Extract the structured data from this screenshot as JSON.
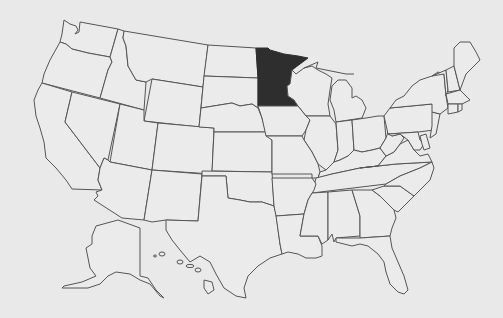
{
  "map": {
    "title": "United States map",
    "highlighted_state": "Minnesota",
    "colors": {
      "background": "#e9e9e9",
      "state_fill": "#ebebeb",
      "border": "#555555",
      "highlight": "#2e2e2e"
    },
    "states_shown": [
      "Washington",
      "Oregon",
      "California",
      "Idaho",
      "Nevada",
      "Montana",
      "Wyoming",
      "Utah",
      "Arizona",
      "Colorado",
      "New Mexico",
      "North Dakota",
      "South Dakota",
      "Nebraska",
      "Kansas",
      "Oklahoma",
      "Texas",
      "Minnesota",
      "Iowa",
      "Missouri",
      "Arkansas",
      "Louisiana",
      "Wisconsin",
      "Illinois",
      "Michigan",
      "Indiana",
      "Ohio",
      "Kentucky",
      "Tennessee",
      "Mississippi",
      "Alabama",
      "Georgia",
      "Florida",
      "South Carolina",
      "North Carolina",
      "Virginia",
      "West Virginia",
      "Pennsylvania",
      "New York",
      "Maryland",
      "Delaware",
      "New Jersey",
      "Connecticut",
      "Rhode Island",
      "Massachusetts",
      "Vermont",
      "New Hampshire",
      "Maine",
      "Alaska",
      "Hawaii"
    ]
  }
}
